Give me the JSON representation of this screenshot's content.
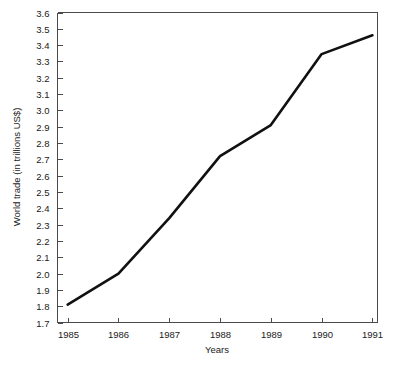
{
  "chart_data": {
    "type": "line",
    "title": "",
    "subtitle": "",
    "xlabel": "Years",
    "ylabel": "World trade (in trillions US$)",
    "x": [
      1985,
      1986,
      1987,
      1988,
      1989,
      1990,
      1991
    ],
    "categories": [
      "1985",
      "1986",
      "1987",
      "1988",
      "1989",
      "1990",
      "1991"
    ],
    "values": [
      1.81,
      2.0,
      2.34,
      2.72,
      2.91,
      3.345,
      3.46
    ],
    "series": [
      {
        "name": "World trade",
        "values": [
          1.81,
          2.0,
          2.34,
          2.72,
          2.91,
          3.345,
          3.46
        ]
      }
    ],
    "xlim": [
      1984.8,
      1991.1
    ],
    "ylim": [
      1.7,
      3.6
    ],
    "ytick_labels": [
      "1.7",
      "1.8",
      "1.9",
      "2.0",
      "2.1",
      "2.2",
      "2.3",
      "2.4",
      "2.5",
      "2.6",
      "2.7",
      "2.8",
      "2.9",
      "3.0",
      "3.1",
      "3.2",
      "3.3",
      "3.4",
      "3.5",
      "3.6"
    ],
    "ytick_values": [
      1.7,
      1.8,
      1.9,
      2.0,
      2.1,
      2.2,
      2.3,
      2.4,
      2.5,
      2.6,
      2.7,
      2.8,
      2.9,
      3.0,
      3.1,
      3.2,
      3.3,
      3.4,
      3.5,
      3.6
    ],
    "xtick_labels": [
      "1985",
      "1986",
      "1987",
      "1988",
      "1989",
      "1990",
      "1991"
    ],
    "grid": false,
    "legend": false,
    "legend_position": "none",
    "line_color": "#111111",
    "axis_color": "#4a4a4a",
    "background_color": "#ffffff"
  }
}
